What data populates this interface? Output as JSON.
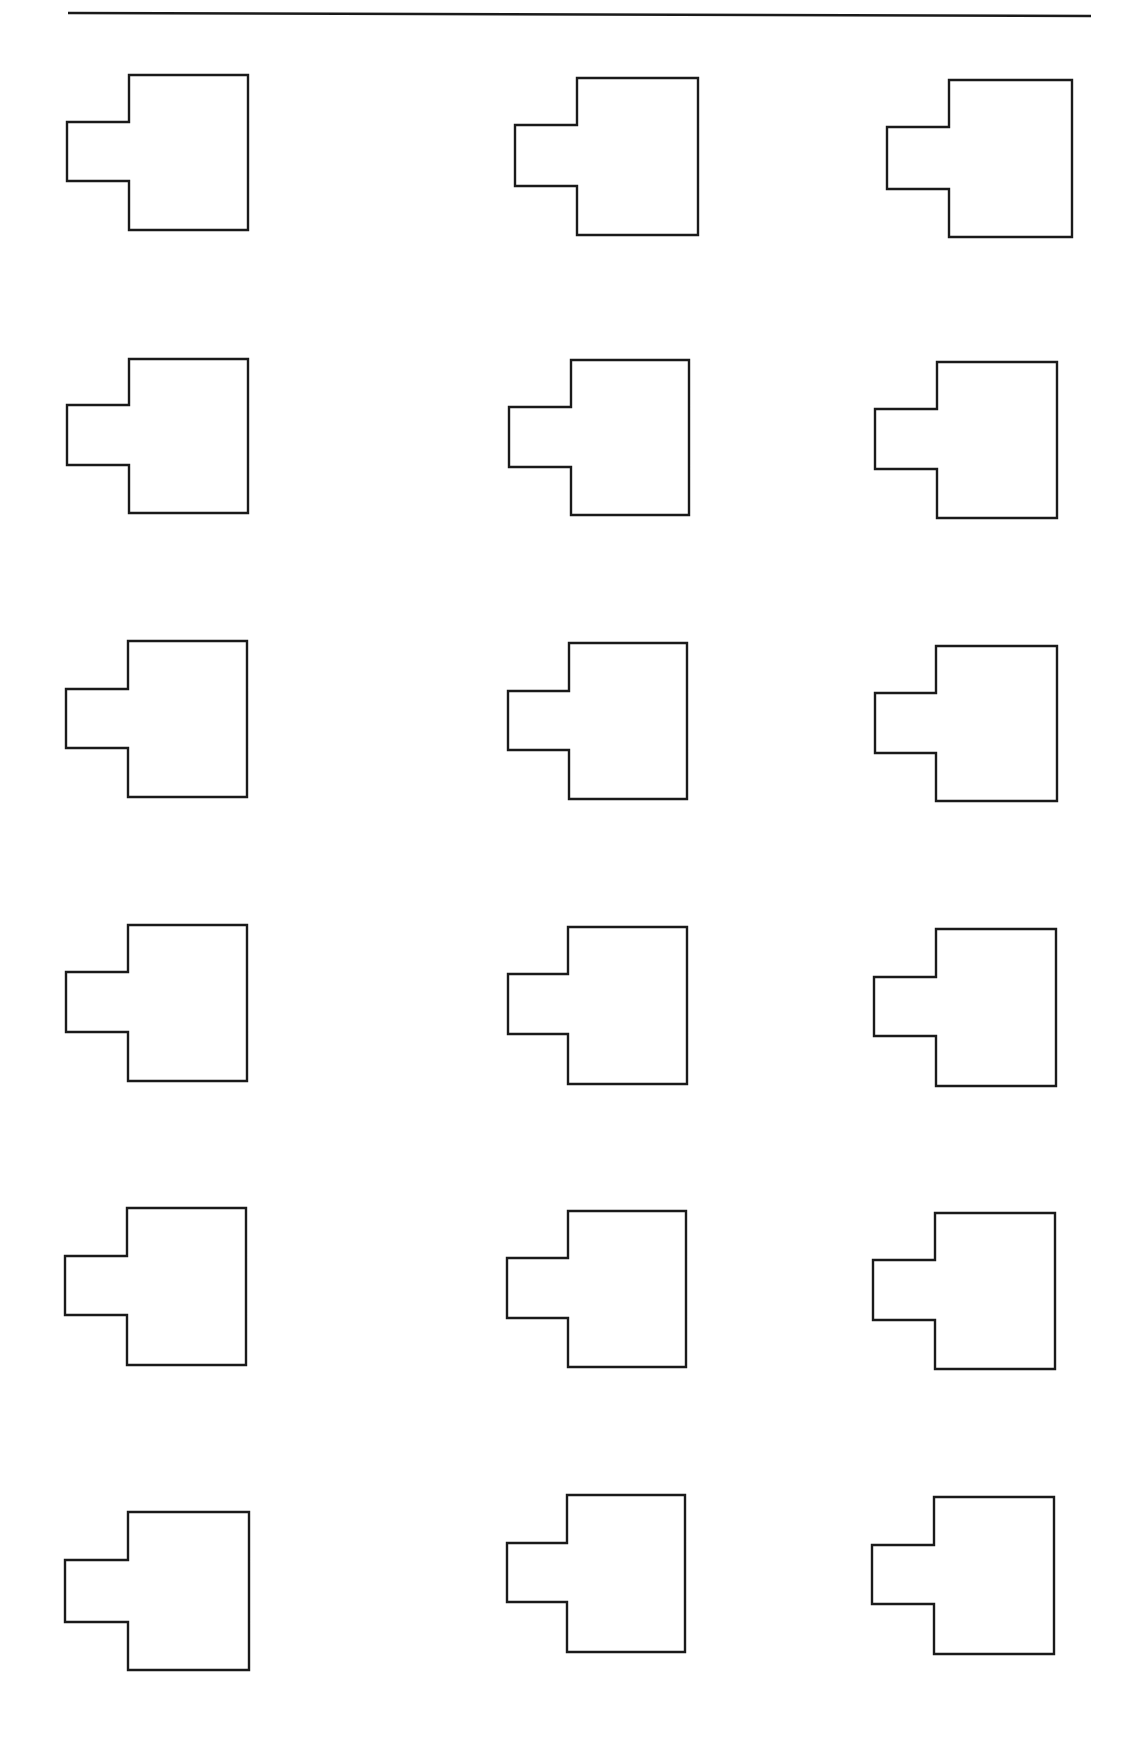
{
  "page": {
    "width": 1130,
    "height": 1752,
    "background": "#ffffff",
    "stroke_color": "#1a1a1a",
    "stroke_width": 2.4
  },
  "top_rule": {
    "x1": 68,
    "y1": 13,
    "x2": 1091,
    "y2": 16
  },
  "shape_description": "T-shaped outline: rectangle with a smaller rectangular tab protruding from the left side",
  "shapes": [
    {
      "row": 1,
      "col": 1,
      "body": [
        129,
        75,
        248,
        230
      ],
      "tab": [
        67,
        122,
        181
      ]
    },
    {
      "row": 1,
      "col": 2,
      "body": [
        577,
        78,
        698,
        235
      ],
      "tab": [
        515,
        125,
        186
      ]
    },
    {
      "row": 1,
      "col": 3,
      "body": [
        949,
        80,
        1072,
        237
      ],
      "tab": [
        887,
        127,
        189
      ]
    },
    {
      "row": 2,
      "col": 1,
      "body": [
        129,
        359,
        248,
        513
      ],
      "tab": [
        67,
        405,
        465
      ]
    },
    {
      "row": 2,
      "col": 2,
      "body": [
        571,
        360,
        689,
        515
      ],
      "tab": [
        509,
        407,
        467
      ]
    },
    {
      "row": 2,
      "col": 3,
      "body": [
        937,
        362,
        1057,
        518
      ],
      "tab": [
        875,
        409,
        469
      ]
    },
    {
      "row": 3,
      "col": 1,
      "body": [
        128,
        641,
        247,
        797
      ],
      "tab": [
        66,
        689,
        748
      ]
    },
    {
      "row": 3,
      "col": 2,
      "body": [
        569,
        643,
        687,
        799
      ],
      "tab": [
        508,
        691,
        750
      ]
    },
    {
      "row": 3,
      "col": 3,
      "body": [
        936,
        646,
        1057,
        801
      ],
      "tab": [
        875,
        693,
        753
      ]
    },
    {
      "row": 4,
      "col": 1,
      "body": [
        128,
        925,
        247,
        1081
      ],
      "tab": [
        66,
        972,
        1032
      ]
    },
    {
      "row": 4,
      "col": 2,
      "body": [
        568,
        927,
        687,
        1084
      ],
      "tab": [
        508,
        974,
        1034
      ]
    },
    {
      "row": 4,
      "col": 3,
      "body": [
        936,
        929,
        1056,
        1086
      ],
      "tab": [
        874,
        977,
        1036
      ]
    },
    {
      "row": 5,
      "col": 1,
      "body": [
        127,
        1208,
        246,
        1365
      ],
      "tab": [
        65,
        1256,
        1315
      ]
    },
    {
      "row": 5,
      "col": 2,
      "body": [
        568,
        1211,
        686,
        1367
      ],
      "tab": [
        507,
        1258,
        1318
      ]
    },
    {
      "row": 5,
      "col": 3,
      "body": [
        935,
        1213,
        1055,
        1369
      ],
      "tab": [
        873,
        1260,
        1320
      ]
    },
    {
      "row": 6,
      "col": 1,
      "body": [
        128,
        1512,
        249,
        1670
      ],
      "tab": [
        65,
        1560,
        1622
      ]
    },
    {
      "row": 6,
      "col": 2,
      "body": [
        567,
        1495,
        685,
        1652
      ],
      "tab": [
        507,
        1543,
        1602
      ]
    },
    {
      "row": 6,
      "col": 3,
      "body": [
        934,
        1497,
        1054,
        1654
      ],
      "tab": [
        872,
        1545,
        1604
      ]
    }
  ]
}
